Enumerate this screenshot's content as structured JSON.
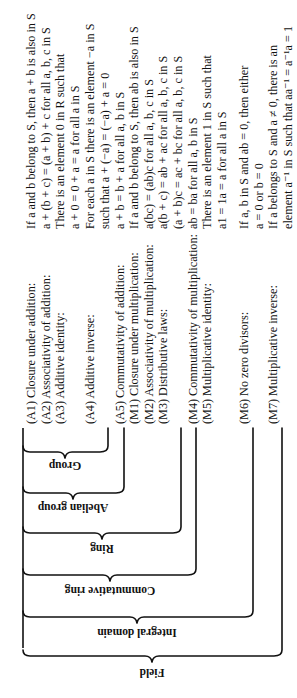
{
  "diagram": {
    "title_hint": "Hierarchy of algebraic structures",
    "properties": [
      {
        "id": "A1",
        "label": "(A1) Closure under addition:",
        "statement_lines": [
          1
        ]
      },
      {
        "id": "A2",
        "label": "(A2) Associativity of addition:",
        "statement_lines": [
          2
        ]
      },
      {
        "id": "A3",
        "label": "(A3) Additive identity:",
        "statement_lines": [
          3,
          4
        ]
      },
      {
        "id": "A4",
        "label": "(A4) Additive inverse:",
        "statement_lines": [
          5,
          6
        ]
      },
      {
        "id": "A5",
        "label": "(A5) Commutativity of addition:",
        "statement_lines": [
          7
        ]
      },
      {
        "id": "M1",
        "label": "(M1) Closure under multiplication:",
        "statement_lines": [
          8
        ]
      },
      {
        "id": "M2",
        "label": "(M2) Associativity of multiplication:",
        "statement_lines": [
          9
        ]
      },
      {
        "id": "M3",
        "label": "(M3) Distributive laws:",
        "statement_lines": [
          10,
          11
        ]
      },
      {
        "id": "M4",
        "label": "(M4) Commutativity of multiplication:",
        "statement_lines": [
          12
        ]
      },
      {
        "id": "M5",
        "label": "(M5) Multiplicative identity:",
        "statement_lines": [
          13,
          14
        ]
      },
      {
        "id": "M6",
        "label": "(M6) No zero divisors:",
        "statement_lines": [
          15,
          16
        ]
      },
      {
        "id": "M7",
        "label": "(M7) Multiplicative inverse:",
        "statement_lines": [
          17,
          18
        ]
      }
    ],
    "statements": [
      "If a and b belong to S, then a + b is also in S",
      "a + (b + c) = (a + b) + c for all a, b, c in S",
      "There is an element 0 in R such that",
      "a + 0 = 0 + a = a for all a in S",
      "For each a in S there is an element −a in S",
      "such that a + (−a) = (−a) + a = 0",
      "a + b = b + a for all a, b in S",
      "If a and b belong to S, then ab is also in S",
      "a(bc) = (ab)c for all a, b, c in S",
      "a(b + c) = ab + ac for all a, b, c in S",
      "(a + b)c = ac + bc for all a, b, c in S",
      "ab = ba for all a, b in S",
      "There is an element 1 in S such that",
      "a1 = 1a = a for all a in S",
      "If a, b in S and ab = 0, then either",
      "a = 0 or b = 0",
      "If a belongs to S and a ≠ 0, there is an",
      "element a⁻¹ in S such that aa⁻¹ = a⁻¹a = 1"
    ],
    "structures": [
      {
        "name": "Group",
        "includes": [
          "A1",
          "A2",
          "A3",
          "A4"
        ]
      },
      {
        "name": "Abelian group",
        "includes": [
          "A1",
          "A2",
          "A3",
          "A4",
          "A5"
        ]
      },
      {
        "name": "Ring",
        "includes": [
          "A1",
          "A2",
          "A3",
          "A4",
          "A5",
          "M1",
          "M2",
          "M3"
        ]
      },
      {
        "name": "Commutative ring",
        "includes": [
          "A1",
          "A2",
          "A3",
          "A4",
          "A5",
          "M1",
          "M2",
          "M3",
          "M4"
        ]
      },
      {
        "name": "Integral domain",
        "includes": [
          "A1",
          "A2",
          "A3",
          "A4",
          "A5",
          "M1",
          "M2",
          "M3",
          "M4",
          "M5",
          "M6"
        ]
      },
      {
        "name": "Field",
        "includes": [
          "A1",
          "A2",
          "A3",
          "A4",
          "A5",
          "M1",
          "M2",
          "M3",
          "M4",
          "M5",
          "M6",
          "M7"
        ]
      }
    ],
    "orientation": "rotated 90° counter-clockwise",
    "colors": {
      "ink": "#111111",
      "background": "#ffffff"
    }
  }
}
